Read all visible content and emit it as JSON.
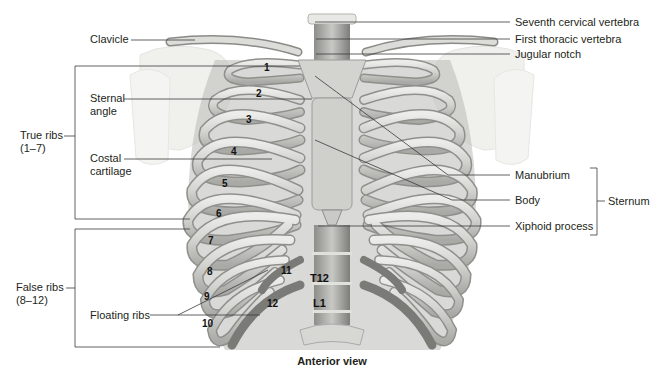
{
  "caption": "Anterior view",
  "labels_left": {
    "clavicle": "Clavicle",
    "sternal_angle_1": "Sternal",
    "sternal_angle_2": "angle",
    "costal_cartilage_1": "Costal",
    "costal_cartilage_2": "cartilage",
    "true_ribs_1": "True ribs",
    "true_ribs_2": "(1–7)",
    "false_ribs_1": "False ribs",
    "false_ribs_2": "(8–12)",
    "floating_ribs": "Floating ribs"
  },
  "labels_right": {
    "seventh_cervical": "Seventh cervical vertebra",
    "first_thoracic": "First thoracic vertebra",
    "jugular_notch": "Jugular notch",
    "manubrium": "Manubrium",
    "body": "Body",
    "xiphoid": "Xiphoid process",
    "sternum": "Sternum"
  },
  "rib_numbers": [
    "1",
    "2",
    "3",
    "4",
    "5",
    "6",
    "7",
    "8",
    "9",
    "10",
    "11",
    "12"
  ],
  "vertebrae": {
    "t12": "T12",
    "l1": "L1"
  },
  "colors": {
    "bone": "#d9d9d6",
    "bone_shadow": "#9a9a97",
    "bone_dark": "#6f6f6c",
    "scapula": "#efefec",
    "leader_line": "#3a3a3a"
  }
}
